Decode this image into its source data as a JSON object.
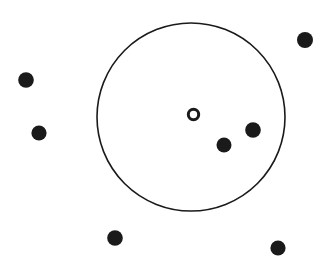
{
  "figure": {
    "title": "",
    "width": 331,
    "height": 265,
    "background_color": "#ffffff",
    "ink_color": "#1a1a1a"
  },
  "chart_data": {
    "type": "scatter",
    "title": "",
    "subtitle": "",
    "xlabel": "",
    "ylabel": "",
    "xlim": [
      0,
      331
    ],
    "ylim": [
      0,
      265
    ],
    "grid": false,
    "axes_visible": false,
    "legend": {
      "visible": false,
      "position": "none",
      "entries": [
        {
          "name": "point",
          "marker": "filled-circle",
          "color": "#1a1a1a"
        },
        {
          "name": "center",
          "marker": "hollow-circle",
          "color": "#1a1a1a"
        }
      ]
    },
    "annotations": [
      {
        "name": "boundary-circle",
        "shape": "circle",
        "cx": 191,
        "cy": 117,
        "r": 94,
        "fill": "none",
        "stroke": "#1a1a1a",
        "stroke_width": 1.6
      }
    ],
    "series": [
      {
        "name": "points-inside-circle",
        "marker": "filled-circle",
        "color": "#1a1a1a",
        "marker_size": 15,
        "points": [
          {
            "x": 224,
            "y": 145,
            "r": 7.5
          },
          {
            "x": 253,
            "y": 130,
            "r": 7.8
          }
        ]
      },
      {
        "name": "points-outside-circle",
        "marker": "filled-circle",
        "color": "#1a1a1a",
        "marker_size": 15,
        "points": [
          {
            "x": 305,
            "y": 40,
            "r": 8.0
          },
          {
            "x": 26,
            "y": 80,
            "r": 7.8
          },
          {
            "x": 39,
            "y": 133,
            "r": 7.6
          },
          {
            "x": 115,
            "y": 238,
            "r": 7.8
          },
          {
            "x": 278,
            "y": 248,
            "r": 7.6
          }
        ]
      },
      {
        "name": "center-marker",
        "marker": "hollow-circle",
        "color": "#1a1a1a",
        "marker_size": 13,
        "points": [
          {
            "x": 193.5,
            "y": 114.5,
            "r": 5.2,
            "stroke_width": 3.0
          }
        ]
      }
    ]
  }
}
